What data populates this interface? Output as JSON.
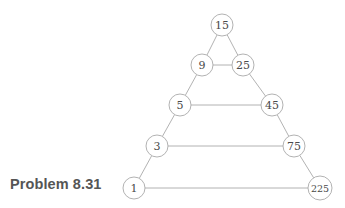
{
  "figure": {
    "caption": "Problem 8.31",
    "background_color": "#ffffff",
    "stroke_color": "#a9a9a9",
    "label_color": "#4a4a4a"
  },
  "chart_data": {
    "type": "diagram",
    "title": "Problem 8.31",
    "nodes": [
      {
        "id": "n15",
        "label": "15",
        "x": 222,
        "y": 25,
        "r": 11,
        "row": 0
      },
      {
        "id": "n9",
        "label": "9",
        "x": 202,
        "y": 65,
        "r": 11,
        "row": 1
      },
      {
        "id": "n25",
        "label": "25",
        "x": 243,
        "y": 65,
        "r": 11,
        "row": 1
      },
      {
        "id": "n5",
        "label": "5",
        "x": 180,
        "y": 105,
        "r": 11,
        "row": 2
      },
      {
        "id": "n45",
        "label": "45",
        "x": 272,
        "y": 105,
        "r": 11,
        "row": 2
      },
      {
        "id": "n3",
        "label": "3",
        "x": 157,
        "y": 146,
        "r": 11,
        "row": 3
      },
      {
        "id": "n75",
        "label": "75",
        "x": 294,
        "y": 146,
        "r": 11,
        "row": 3
      },
      {
        "id": "n1",
        "label": "1",
        "x": 134,
        "y": 188,
        "r": 11,
        "row": 4
      },
      {
        "id": "n225",
        "label": "225",
        "x": 320,
        "y": 188,
        "r": 12,
        "row": 4
      }
    ],
    "edges": [
      {
        "from": "n15",
        "to": "n9"
      },
      {
        "from": "n15",
        "to": "n25"
      },
      {
        "from": "n9",
        "to": "n25"
      },
      {
        "from": "n9",
        "to": "n5"
      },
      {
        "from": "n25",
        "to": "n45"
      },
      {
        "from": "n5",
        "to": "n45"
      },
      {
        "from": "n5",
        "to": "n3"
      },
      {
        "from": "n45",
        "to": "n75"
      },
      {
        "from": "n3",
        "to": "n75"
      },
      {
        "from": "n3",
        "to": "n1"
      },
      {
        "from": "n75",
        "to": "n225"
      },
      {
        "from": "n1",
        "to": "n225"
      }
    ]
  }
}
